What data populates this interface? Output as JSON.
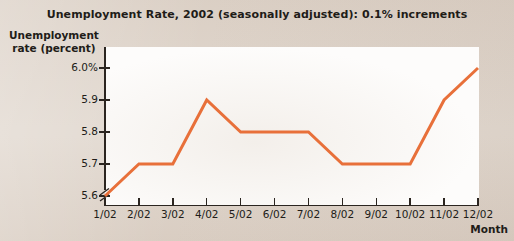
{
  "figure": {
    "background_color": "#DED4CA",
    "plot_background_color": "#FDFCFB",
    "axis_color": "#2B2520"
  },
  "chart_data": {
    "type": "line",
    "title": "Unemployment Rate, 2002 (seasonally adjusted): 0.1% increments",
    "xlabel": "Month",
    "ylabel": "Unemployment rate (percent)",
    "ylabel_line1": "Unemployment",
    "ylabel_line2": "rate (percent)",
    "categories": [
      "1/02",
      "2/02",
      "3/02",
      "4/02",
      "5/02",
      "6/02",
      "7/02",
      "8/02",
      "9/02",
      "10/02",
      "11/02",
      "12/02"
    ],
    "values": [
      5.6,
      5.7,
      5.7,
      5.9,
      5.8,
      5.8,
      5.8,
      5.7,
      5.7,
      5.7,
      5.9,
      6.0
    ],
    "series": [
      {
        "name": "Unemployment rate",
        "color": "#E8703A",
        "values": [
          5.6,
          5.7,
          5.7,
          5.9,
          5.8,
          5.8,
          5.8,
          5.7,
          5.7,
          5.7,
          5.9,
          6.0
        ]
      }
    ],
    "ytick_labels": [
      "6.0%",
      "5.9",
      "5.8",
      "5.7",
      "5.6"
    ],
    "ytick_values": [
      6.0,
      5.9,
      5.8,
      5.7,
      5.6
    ],
    "ylim": [
      5.6,
      6.0
    ],
    "y_axis_break": true,
    "grid": false,
    "legend": false,
    "line_color": "#E8703A",
    "line_width": 3
  }
}
